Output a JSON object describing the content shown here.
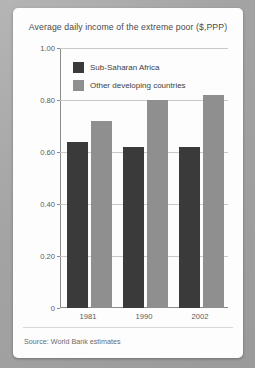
{
  "chart_data": {
    "type": "bar",
    "title": "Average daily income of the extreme poor ($,PPP)",
    "xlabel": "",
    "ylabel": "",
    "categories": [
      "1981",
      "1990",
      "2002"
    ],
    "series": [
      {
        "name": "Sub-Saharan Africa",
        "color": "#3a3a3a",
        "values": [
          0.64,
          0.62,
          0.62
        ]
      },
      {
        "name": "Other developing countries",
        "color": "#8f8f8f",
        "values": [
          0.72,
          0.8,
          0.82
        ]
      }
    ],
    "ylim": [
      0,
      1.0
    ],
    "yticks": [
      "0",
      "0.20",
      "0.40",
      "0.60",
      "0.80",
      "1.00"
    ],
    "ytick_values": [
      0,
      0.2,
      0.4,
      0.6,
      0.8,
      1.0
    ],
    "grid": true,
    "legend_position": "top-left-inside"
  },
  "footer": {
    "source": "Source: World Bank estimates"
  }
}
